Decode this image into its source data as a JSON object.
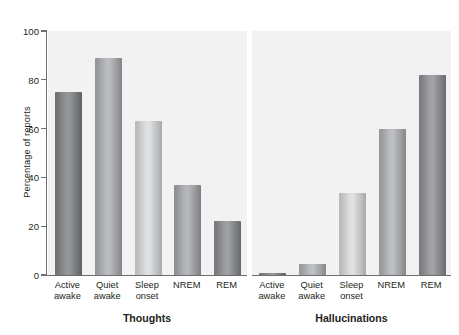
{
  "chart_data": {
    "type": "bar",
    "title": "",
    "xlabel": "",
    "ylabel": "Percentage of reports",
    "ylim": [
      0,
      100
    ],
    "yticks": [
      0,
      20,
      40,
      60,
      80,
      100
    ],
    "ytick_labels": [
      "0",
      "20",
      "40",
      "60",
      "80",
      "100"
    ],
    "grid": false,
    "legend": "none",
    "categories": [
      "Active awake",
      "Quiet awake",
      "Sleep onset",
      "NREM",
      "REM"
    ],
    "category_lines": [
      [
        "Active",
        "awake"
      ],
      [
        "Quiet",
        "awake"
      ],
      [
        "Sleep",
        "onset"
      ],
      [
        "NREM",
        ""
      ],
      [
        "REM",
        ""
      ]
    ],
    "panels": [
      {
        "name": "thoughts",
        "title": "Thoughts",
        "values": [
          75,
          89,
          63,
          37,
          22
        ],
        "bar_colors": [
          "#6f7072",
          "#95969a",
          "#b9babc",
          "#8e9094",
          "#77797c"
        ]
      },
      {
        "name": "hallucinations",
        "title": "Hallucinations",
        "values": [
          1,
          4.5,
          33.5,
          60,
          82
        ],
        "bar_colors": [
          "#6f7072",
          "#97999c",
          "#b9babc",
          "#96989b",
          "#7a7c7f"
        ]
      }
    ],
    "colors": {
      "panel_background": "#f2f2f2",
      "page_background": "#ffffff",
      "axis": "#6d6e71",
      "text": "#231f20"
    }
  }
}
